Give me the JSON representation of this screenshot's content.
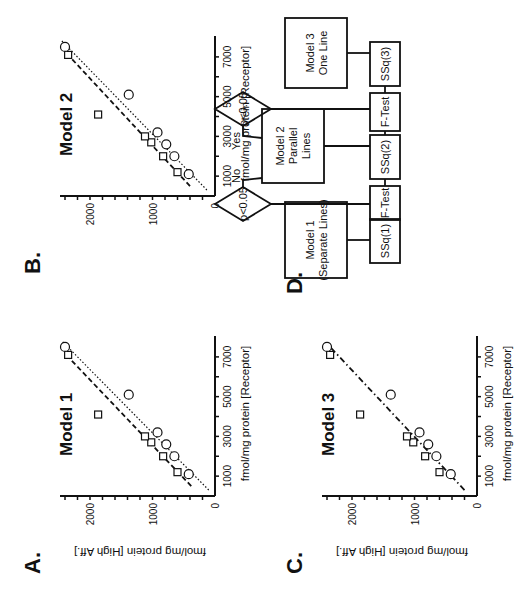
{
  "figure": {
    "panels": [
      {
        "id": "A",
        "label": "A.",
        "title": "Model 1",
        "lines": [
          "separate-square",
          "separate-circle"
        ]
      },
      {
        "id": "B",
        "label": "B.",
        "title": "Model 2",
        "lines": [
          "parallel-square",
          "parallel-circle"
        ]
      },
      {
        "id": "C",
        "label": "C.",
        "title": "Model 3",
        "lines": [
          "one-line"
        ]
      },
      {
        "id": "D",
        "label": "D."
      }
    ],
    "xlabel": "fmol/mg protein [Receptor]",
    "ylabel": "fmol/mg protein [High Aff.]",
    "x_ticks": [
      "1000",
      "3000",
      "5000",
      "7000"
    ],
    "y_ticks": [
      "0",
      "1000",
      "2000"
    ]
  },
  "flowchart": {
    "model1": [
      "Model 1",
      "(Separate Lines)"
    ],
    "model2": [
      "Model 2",
      "Parallel",
      "Lines"
    ],
    "model3": [
      "Model 3",
      "One Line"
    ],
    "ssq1": "SSq(1)",
    "ssq2": "SSq(2)",
    "ssq3": "SSq(3)",
    "ftest1": "F-Test",
    "ftest2": "F-Test",
    "decision1": "p<0.05",
    "decision2": "p<0.05",
    "no_label": "No",
    "yes_label": "Yes"
  },
  "chart_data": [
    {
      "type": "scatter",
      "title": "Model 1",
      "xlabel": "fmol/mg protein [Receptor]",
      "ylabel": "fmol/mg protein [High Aff.]",
      "xlim": [
        0,
        7800
      ],
      "ylim": [
        0,
        2400
      ],
      "x_ticks": [
        1000,
        3000,
        5000,
        7000
      ],
      "y_ticks": [
        0,
        1000,
        2000
      ],
      "series": [
        {
          "name": "squares",
          "marker": "square",
          "x": [
            1200,
            2000,
            2700,
            3000,
            4100,
            7100
          ],
          "y": [
            600,
            830,
            1020,
            1120,
            1870,
            2350
          ]
        },
        {
          "name": "circles",
          "marker": "circle",
          "x": [
            1100,
            2000,
            2600,
            3200,
            5100,
            7500
          ],
          "y": [
            420,
            650,
            780,
            920,
            1380,
            2400
          ]
        }
      ],
      "fit_lines": [
        {
          "name": "squares fit",
          "style": "dashed",
          "x": [
            500,
            7000
          ],
          "y": [
            380,
            2350
          ]
        },
        {
          "name": "circles fit",
          "style": "dotted",
          "x": [
            300,
            7800
          ],
          "y": [
            100,
            2450
          ]
        }
      ]
    },
    {
      "type": "scatter",
      "title": "Model 2",
      "xlabel": "fmol/mg protein [Receptor]",
      "ylabel": "fmol/mg protein [High Aff.]",
      "xlim": [
        0,
        7800
      ],
      "ylim": [
        0,
        2400
      ],
      "x_ticks": [
        1000,
        3000,
        5000,
        7000
      ],
      "y_ticks": [
        0,
        1000,
        2000
      ],
      "series": [
        {
          "name": "squares",
          "marker": "square",
          "x": [
            1200,
            2000,
            2700,
            3000,
            4100,
            7100
          ],
          "y": [
            600,
            830,
            1020,
            1120,
            1870,
            2350
          ]
        },
        {
          "name": "circles",
          "marker": "circle",
          "x": [
            1100,
            2000,
            2600,
            3200,
            5100,
            7500
          ],
          "y": [
            420,
            650,
            780,
            920,
            1380,
            2400
          ]
        }
      ],
      "fit_lines": [
        {
          "name": "squares fit (parallel)",
          "style": "dashed",
          "x": [
            500,
            7100
          ],
          "y": [
            400,
            2350
          ]
        },
        {
          "name": "circles fit (parallel)",
          "style": "dotted",
          "x": [
            300,
            7800
          ],
          "y": [
            130,
            2450
          ]
        }
      ]
    },
    {
      "type": "scatter",
      "title": "Model 3",
      "xlabel": "fmol/mg protein [Receptor]",
      "ylabel": "fmol/mg protein [High Aff.]",
      "xlim": [
        0,
        7800
      ],
      "ylim": [
        0,
        2400
      ],
      "x_ticks": [
        1000,
        3000,
        5000,
        7000
      ],
      "y_ticks": [
        0,
        1000,
        2000
      ],
      "series": [
        {
          "name": "squares",
          "marker": "square",
          "x": [
            1200,
            2000,
            2700,
            3000,
            4100,
            7100
          ],
          "y": [
            600,
            830,
            1020,
            1120,
            1870,
            2350
          ]
        },
        {
          "name": "circles",
          "marker": "circle",
          "x": [
            1100,
            2000,
            2600,
            3200,
            5100,
            7500
          ],
          "y": [
            420,
            650,
            780,
            920,
            1380,
            2400
          ]
        }
      ],
      "fit_lines": [
        {
          "name": "single line",
          "style": "dash-dot",
          "x": [
            300,
            7500
          ],
          "y": [
            200,
            2350
          ]
        }
      ]
    }
  ]
}
